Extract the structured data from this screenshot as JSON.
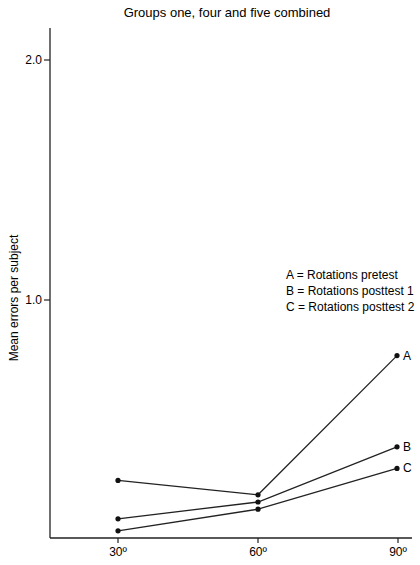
{
  "chart_data": {
    "type": "line",
    "title": "Groups one, four and five combined",
    "xlabel": "",
    "ylabel": "Mean errors per subject",
    "categories": [
      "30º",
      "60º",
      "90º"
    ],
    "x": [
      30,
      60,
      90
    ],
    "yticks": [
      "2.0",
      "1.0"
    ],
    "ylim": [
      0,
      2.1
    ],
    "grid": false,
    "legend_position": "right-middle",
    "legend": [
      "A = Rotations pretest",
      "B = Rotations posttest 1",
      "C = Rotations posttest 2"
    ],
    "series": [
      {
        "name": "A",
        "label": "Rotations pretest",
        "values": [
          0.24,
          0.18,
          0.76
        ]
      },
      {
        "name": "B",
        "label": "Rotations posttest 1",
        "values": [
          0.08,
          0.15,
          0.38
        ]
      },
      {
        "name": "C",
        "label": "Rotations posttest 2",
        "values": [
          0.03,
          0.12,
          0.29
        ]
      }
    ]
  }
}
